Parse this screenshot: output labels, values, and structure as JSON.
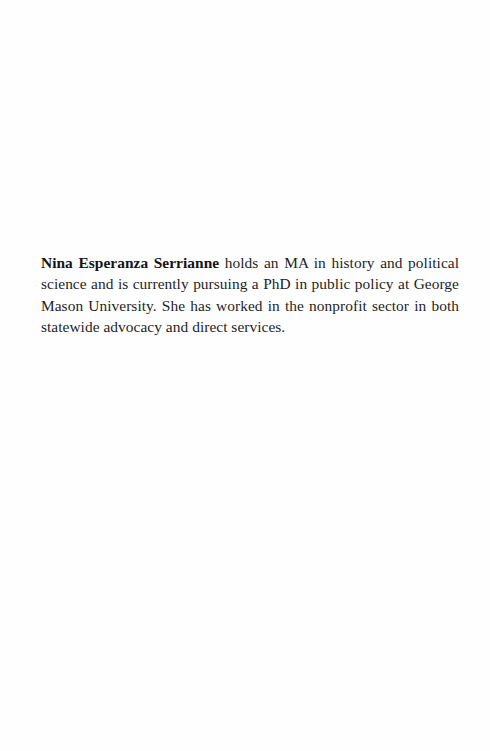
{
  "document": {
    "bio": {
      "name": "Nina Esperanza Serrianne",
      "text": " holds an MA in history and political science and is currently pursuing a PhD in public policy at George Mason University. She has worked in the nonprofit sector in both statewide advocacy and direct services."
    }
  }
}
